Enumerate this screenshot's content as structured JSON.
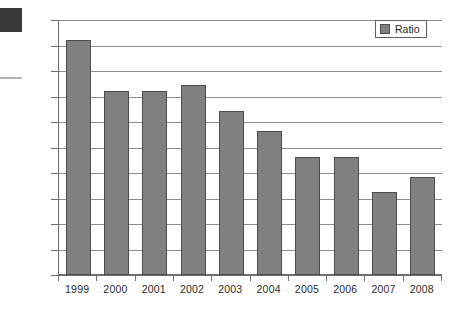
{
  "chart_data": {
    "type": "bar",
    "title": "",
    "xlabel": "",
    "ylabel": "",
    "categories": [
      "1999",
      "2000",
      "2001",
      "2002",
      "2003",
      "2004",
      "2005",
      "2006",
      "2007",
      "2008"
    ],
    "values": [
      261.1,
      251.1,
      251.1,
      252.2,
      247.2,
      243.2,
      238.2,
      238.2,
      231.2,
      234.3
    ],
    "series": [
      {
        "name": "Ratio",
        "values": [
          261.1,
          251.1,
          251.1,
          252.2,
          247.2,
          243.2,
          238.2,
          238.2,
          231.2,
          234.3
        ]
      }
    ],
    "ylim": [
      215,
      265
    ],
    "ytick_step": 5,
    "yticks": [
      215,
      220,
      225,
      230,
      235,
      240,
      245,
      250,
      255,
      260,
      265
    ],
    "ytick_labels": [
      "215",
      "220",
      "225",
      "230",
      "235",
      "240",
      "245",
      "250",
      "255",
      "260",
      "265"
    ],
    "grid": true,
    "grid_axis": "y",
    "legend": {
      "position": "top-right",
      "entries": [
        {
          "label": "Ratio",
          "color": "#808080"
        }
      ]
    },
    "colors": {
      "bar_fill": "#808080",
      "bar_border": "#4d4d4d",
      "gridline": "#8c8c8c",
      "axis": "#6e6e6e",
      "text": "#2b2b2b",
      "background": "#ffffff"
    }
  },
  "artifacts": {
    "corner_blob_color": "#3a3a3a",
    "edge_dash_color": "#b6b6b6"
  }
}
